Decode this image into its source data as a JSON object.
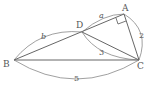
{
  "figure": {
    "type": "geometry-diagram",
    "points": {
      "A": {
        "label": "A",
        "x": 124,
        "y": 14
      },
      "B": {
        "label": "B",
        "x": 14,
        "y": 60
      },
      "C": {
        "label": "C",
        "x": 139,
        "y": 60
      },
      "D": {
        "label": "D",
        "x": 82,
        "y": 32
      }
    },
    "segments": [
      "AB",
      "AC",
      "BC",
      "DC"
    ],
    "right_angle_at": "A",
    "lengths": {
      "AD": "a",
      "BD": "b",
      "DC": "3",
      "AC": "2",
      "BC": "5"
    },
    "colors": {
      "stroke": "#555555",
      "background": "#ffffff"
    }
  }
}
